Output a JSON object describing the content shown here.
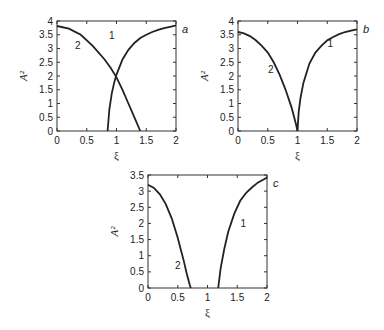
{
  "chart_data": [
    {
      "panel": "a",
      "type": "line",
      "xlabel": "ξ",
      "ylabel": "A²",
      "xlim": [
        0,
        2
      ],
      "ylim": [
        0,
        4
      ],
      "xticks": [
        "0",
        "0.5",
        "1",
        "1.5",
        "2"
      ],
      "yticks": [
        "0",
        "0.5",
        "1",
        "1.5",
        "2",
        "2.5",
        "3",
        "3.5",
        "4"
      ],
      "grid": false,
      "series": [
        {
          "name": "1",
          "x": [
            0.85,
            0.88,
            0.92,
            0.96,
            1.0,
            1.1,
            1.2,
            1.3,
            1.4,
            1.5,
            1.6,
            1.7,
            1.8,
            1.9,
            2.0
          ],
          "y": [
            0,
            0.8,
            1.35,
            1.75,
            2.05,
            2.6,
            2.95,
            3.2,
            3.38,
            3.5,
            3.6,
            3.68,
            3.74,
            3.79,
            3.84
          ]
        },
        {
          "name": "2",
          "x": [
            0,
            0.2,
            0.4,
            0.6,
            0.8,
            0.9,
            1.0,
            1.1,
            1.2,
            1.3,
            1.4
          ],
          "y": [
            3.82,
            3.72,
            3.5,
            3.1,
            2.6,
            2.3,
            1.95,
            1.5,
            1.0,
            0.5,
            0
          ]
        }
      ]
    },
    {
      "panel": "b",
      "type": "line",
      "xlabel": "ξ",
      "ylabel": "A²",
      "xlim": [
        0,
        2
      ],
      "ylim": [
        0,
        4
      ],
      "xticks": [
        "0",
        "0.5",
        "1",
        "1.5",
        "2"
      ],
      "yticks": [
        "0",
        "0.5",
        "1",
        "1.5",
        "2",
        "2.5",
        "3",
        "3.5",
        "4"
      ],
      "grid": false,
      "series": [
        {
          "name": "1",
          "x": [
            1.0,
            1.02,
            1.05,
            1.1,
            1.2,
            1.3,
            1.4,
            1.5,
            1.6,
            1.7,
            1.8,
            1.9,
            2.0
          ],
          "y": [
            0,
            0.7,
            1.2,
            1.75,
            2.45,
            2.85,
            3.1,
            3.3,
            3.42,
            3.52,
            3.6,
            3.65,
            3.7
          ]
        },
        {
          "name": "2",
          "x": [
            0,
            0.1,
            0.2,
            0.3,
            0.4,
            0.5,
            0.6,
            0.7,
            0.8,
            0.9,
            0.95,
            0.98,
            1.0
          ],
          "y": [
            3.6,
            3.55,
            3.45,
            3.3,
            3.1,
            2.85,
            2.5,
            2.05,
            1.5,
            0.85,
            0.45,
            0.2,
            0
          ]
        }
      ]
    },
    {
      "panel": "c",
      "type": "line",
      "xlabel": "ξ",
      "ylabel": "A²",
      "xlim": [
        0,
        2
      ],
      "ylim": [
        0,
        3.5
      ],
      "xticks": [
        "0",
        "0.5",
        "1",
        "1.5",
        "2"
      ],
      "yticks": [
        "0",
        "0.5",
        "1",
        "1.5",
        "2",
        "2.5",
        "3",
        "3.5"
      ],
      "grid": false,
      "series": [
        {
          "name": "1",
          "x": [
            1.18,
            1.22,
            1.28,
            1.35,
            1.45,
            1.55,
            1.65,
            1.75,
            1.85,
            1.95,
            2.0
          ],
          "y": [
            0,
            0.6,
            1.2,
            1.75,
            2.3,
            2.7,
            2.95,
            3.12,
            3.27,
            3.37,
            3.42
          ]
        },
        {
          "name": "2",
          "x": [
            0,
            0.1,
            0.2,
            0.3,
            0.4,
            0.5,
            0.55,
            0.6,
            0.65,
            0.7,
            0.72
          ],
          "y": [
            3.2,
            3.1,
            2.9,
            2.6,
            2.15,
            1.55,
            1.2,
            0.85,
            0.45,
            0.1,
            0
          ]
        }
      ]
    }
  ]
}
